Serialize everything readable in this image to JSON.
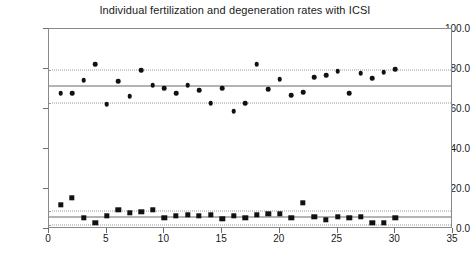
{
  "chart_data": {
    "type": "scatter",
    "title": "Individual fertilization and degeneration rates with ICSI",
    "xlabel": "",
    "ylabel": "",
    "xlim": [
      0,
      35
    ],
    "ylim": [
      0,
      100
    ],
    "xticks": [
      0,
      5,
      10,
      15,
      20,
      25,
      30,
      35
    ],
    "xtick_labels": [
      "0",
      "5",
      "10",
      "15",
      "20",
      "25",
      "30",
      "35"
    ],
    "yticks": [
      0,
      20,
      40,
      60,
      80,
      100
    ],
    "ytick_labels": [
      "0.0",
      "20.0",
      "40.0",
      "60.0",
      "80.0",
      "100.0"
    ],
    "grid": false,
    "legend": "none",
    "series": [
      {
        "name": "Fertilization rate",
        "marker": "diamond",
        "color": "#111111",
        "x": [
          1,
          2,
          3,
          4,
          5,
          6,
          7,
          8,
          9,
          10,
          11,
          12,
          13,
          14,
          15,
          16,
          17,
          18,
          19,
          20,
          21,
          22,
          23,
          24,
          25,
          26,
          27,
          28,
          29,
          30
        ],
        "y": [
          68.0,
          68.0,
          74.5,
          82.5,
          62.5,
          74.0,
          66.5,
          79.5,
          72.0,
          70.5,
          68.0,
          72.0,
          69.5,
          63.0,
          70.5,
          59.0,
          63.0,
          82.5,
          70.0,
          75.0,
          67.0,
          68.5,
          76.0,
          77.0,
          79.0,
          68.0,
          78.0,
          75.5,
          78.5,
          80.0
        ]
      },
      {
        "name": "Degeneration rate",
        "marker": "square",
        "color": "#111111",
        "x": [
          1,
          2,
          3,
          4,
          5,
          6,
          7,
          8,
          9,
          10,
          11,
          12,
          13,
          14,
          15,
          16,
          17,
          18,
          19,
          20,
          21,
          22,
          23,
          24,
          25,
          26,
          27,
          28,
          29,
          30
        ],
        "y": [
          12.0,
          15.5,
          5.5,
          3.0,
          6.5,
          9.5,
          8.0,
          8.5,
          9.5,
          5.5,
          6.5,
          7.0,
          6.5,
          7.0,
          5.0,
          6.5,
          5.5,
          7.0,
          7.5,
          7.5,
          5.5,
          13.0,
          6.0,
          4.5,
          6.0,
          5.5,
          6.0,
          3.0,
          3.0,
          5.5
        ]
      }
    ],
    "reference_lines": [
      {
        "group": "fertilization",
        "kind": "mean",
        "style": "solid",
        "value": 71.5
      },
      {
        "group": "fertilization",
        "kind": "upper-band",
        "style": "dotted",
        "value": 79.5
      },
      {
        "group": "fertilization",
        "kind": "lower-band",
        "style": "dotted",
        "value": 63.0
      },
      {
        "group": "degeneration",
        "kind": "mean",
        "style": "solid",
        "value": 5.8
      },
      {
        "group": "degeneration",
        "kind": "upper-band",
        "style": "dotted",
        "value": 9.0
      },
      {
        "group": "degeneration",
        "kind": "lower-band",
        "style": "dotted",
        "value": 2.2
      }
    ]
  }
}
